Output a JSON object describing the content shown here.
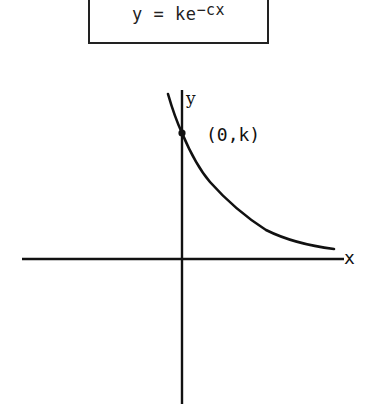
{
  "formula": {
    "lhs": "y = ke",
    "exponent": "−cx"
  },
  "axes": {
    "x_label": "x",
    "y_label": "y"
  },
  "point": {
    "label": "(0,k)"
  },
  "curve": {
    "type": "exponential-decay",
    "equation": "y = ke^(-cx)"
  },
  "colors": {
    "ink": "#111111",
    "background": "#ffffff"
  }
}
